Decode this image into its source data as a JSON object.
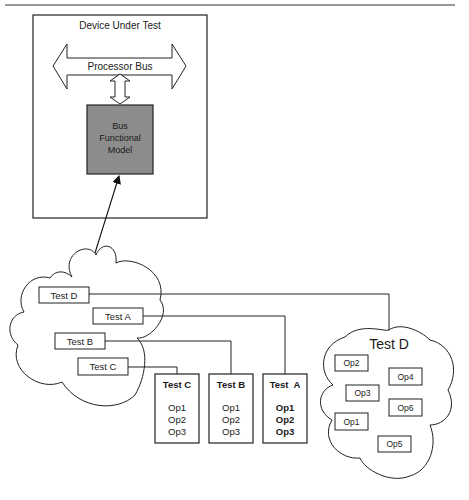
{
  "dut": {
    "title": "Device Under Test",
    "bus_label": "Processor Bus",
    "bfm_lines": [
      "Bus",
      "Functional",
      "Model"
    ],
    "bfm_color": "#8c8c8c"
  },
  "left_cloud": {
    "tests": [
      {
        "label": "Test D"
      },
      {
        "label": "Test A"
      },
      {
        "label": "Test B"
      },
      {
        "label": "Test C"
      }
    ]
  },
  "test_boxes": [
    {
      "title": "Test C",
      "ops": [
        "Op1",
        "Op2",
        "Op3"
      ],
      "bold": false
    },
    {
      "title": "Test B",
      "ops": [
        "Op1",
        "Op2",
        "Op3"
      ],
      "bold": false
    },
    {
      "title": "Test  A",
      "ops": [
        "Op1",
        "Op2",
        "Op3"
      ],
      "bold": true
    }
  ],
  "right_cloud": {
    "title": "Test D",
    "ops": [
      "Op2",
      "Op4",
      "Op3",
      "Op6",
      "Op1",
      "Op5"
    ]
  }
}
